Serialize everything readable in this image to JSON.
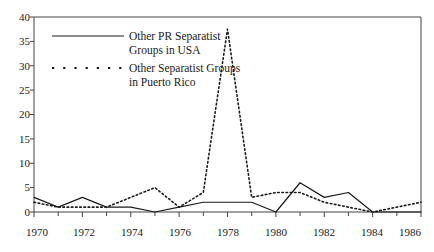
{
  "chart_data": {
    "type": "line",
    "title": "",
    "subtitle": "",
    "xlabel": "",
    "ylabel": "",
    "xlim": [
      1970,
      1986
    ],
    "ylim": [
      0,
      40
    ],
    "yticks": [
      0,
      5,
      10,
      15,
      20,
      25,
      30,
      35,
      40
    ],
    "xticks": [
      1970,
      1971,
      1972,
      1973,
      1974,
      1975,
      1976,
      1977,
      1978,
      1979,
      1980,
      1981,
      1982,
      1983,
      1984,
      1985,
      1986
    ],
    "xtick_labels_shown": [
      1970,
      1972,
      1974,
      1976,
      1978,
      1980,
      1982,
      1984,
      1986
    ],
    "grid": false,
    "legend_position": "top-left",
    "x": [
      1970,
      1971,
      1972,
      1973,
      1974,
      1975,
      1976,
      1977,
      1978,
      1979,
      1980,
      1981,
      1982,
      1983,
      1984,
      1985,
      1986
    ],
    "series": [
      {
        "name": "Other PR Separatist Groups in USA",
        "style": "solid",
        "color": "#1a1a1a",
        "values": [
          3,
          1,
          3,
          1,
          1,
          0,
          1,
          2,
          2,
          2,
          0,
          6,
          3,
          4,
          0,
          0,
          0
        ]
      },
      {
        "name": "Other Separatist Groups in Puerto Rico",
        "style": "dotted",
        "color": "#1a1a1a",
        "values": [
          2,
          1,
          1,
          1,
          3,
          5,
          1,
          4,
          37.5,
          3,
          4,
          4,
          2,
          1,
          0,
          1,
          2
        ]
      }
    ]
  },
  "legend": {
    "entries": [
      {
        "line1": "Other PR Separatist",
        "line2": "Groups in USA",
        "style": "solid"
      },
      {
        "line1": "Other Separatist Groups",
        "line2": "in Puerto Rico",
        "style": "dotted"
      }
    ]
  },
  "axis": {
    "y_labels": [
      "40",
      "35",
      "30",
      "25",
      "20",
      "15",
      "10",
      "5",
      "0"
    ],
    "x_labels": [
      "1970",
      "1972",
      "1974",
      "1976",
      "1978",
      "1980",
      "1982",
      "1984",
      "1986"
    ]
  },
  "colors": {
    "axis": "#444444",
    "text": "#1a1a1a",
    "series": "#1a1a1a",
    "background": "#ffffff"
  }
}
